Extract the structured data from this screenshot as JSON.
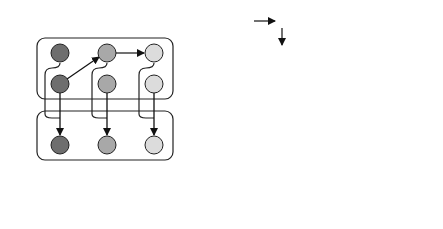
{
  "panel_a": {
    "caption": "(a)",
    "row_labels": {
      "states": "S̃",
      "observations": "Õ"
    },
    "colors": {
      "col1": "#6e6e6e",
      "col2": "#a8a8a8",
      "col3": "#dcdcdc"
    }
  },
  "panel_b": {
    "caption": "(b)",
    "factor_nodes": {
      "C": "C",
      "G": "G",
      "D": "D",
      "B": "B",
      "A": "A"
    },
    "policy_node": "π",
    "states": [
      "s",
      "s",
      "s"
    ],
    "state_subscripts": [
      "t−1",
      "t",
      "t+1"
    ],
    "observations": [
      "o",
      "o",
      "o"
    ],
    "observation_subscripts": [
      "t−1",
      "t",
      "t+1"
    ],
    "colors": {
      "observed_fill": "#dadada",
      "factor_fill": "#333333",
      "factor_text": "#ffffff"
    }
  }
}
